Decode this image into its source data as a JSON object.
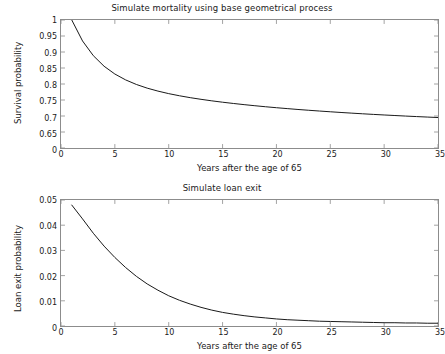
{
  "figure": {
    "width": 444,
    "height": 354,
    "background": "#ffffff",
    "line_color": "#1a1a1a",
    "axis_color": "#8c8c8c",
    "text_color": "#1a1a1a"
  },
  "panels": [
    {
      "title": "Simulate mortality using base geometrical process",
      "xlabel": "Years after the age of 65",
      "ylabel": "Survival probability"
    },
    {
      "title": "Simulate loan exit",
      "xlabel": "Years after the age of 65",
      "ylabel": "Loan exit probability"
    }
  ],
  "chart_data": [
    {
      "type": "line",
      "title": "Simulate mortality using base geometrical process",
      "xlabel": "Years after the age of 65",
      "ylabel": "Survival probability",
      "xlim": [
        0,
        35
      ],
      "ylim": [
        0.6,
        1.0
      ],
      "xticks": [
        0,
        5,
        10,
        15,
        20,
        25,
        30,
        35
      ],
      "xticklabels": [
        "0",
        "5",
        "10",
        "15",
        "20",
        "25",
        "30",
        "35"
      ],
      "yticks": [
        0.6,
        0.65,
        0.7,
        0.75,
        0.8,
        0.85,
        0.9,
        0.95,
        1.0
      ],
      "yticklabels": [
        "0",
        "0.65",
        "0.7",
        "0.75",
        "0.8",
        "0.85",
        "0.9",
        "0.95",
        "1"
      ],
      "grid": false,
      "legend": null,
      "series": [
        {
          "name": "Survival probability",
          "color": "#1a1a1a",
          "x": [
            1,
            2,
            3,
            4,
            5,
            6,
            7,
            8,
            9,
            10,
            11,
            12,
            13,
            14,
            15,
            16,
            17,
            18,
            19,
            20,
            21,
            22,
            23,
            24,
            25,
            26,
            27,
            28,
            29,
            30,
            31,
            32,
            33,
            34,
            35
          ],
          "y": [
            1.0,
            0.9345,
            0.8885,
            0.8555,
            0.8312,
            0.8128,
            0.7985,
            0.7871,
            0.7778,
            0.7699,
            0.7632,
            0.7573,
            0.7521,
            0.7474,
            0.7431,
            0.7392,
            0.7355,
            0.7321,
            0.7289,
            0.7259,
            0.7231,
            0.7204,
            0.7179,
            0.7155,
            0.7132,
            0.711,
            0.7089,
            0.7069,
            0.705,
            0.7032,
            0.7015,
            0.6998,
            0.6982,
            0.6967,
            0.6952
          ]
        }
      ]
    },
    {
      "type": "line",
      "title": "Simulate loan exit",
      "xlabel": "Years after the age of 65",
      "ylabel": "Loan exit probability",
      "xlim": [
        0,
        35
      ],
      "ylim": [
        0,
        0.05
      ],
      "xticks": [
        0,
        5,
        10,
        15,
        20,
        25,
        30,
        35
      ],
      "xticklabels": [
        "0",
        "5",
        "10",
        "15",
        "20",
        "25",
        "30",
        "35"
      ],
      "yticks": [
        0,
        0.01,
        0.02,
        0.03,
        0.04,
        0.05
      ],
      "yticklabels": [
        "0",
        "0.01",
        "0.02",
        "0.03",
        "0.04",
        "0.05"
      ],
      "grid": false,
      "legend": null,
      "series": [
        {
          "name": "Loan exit probability",
          "color": "#1a1a1a",
          "x": [
            1,
            2,
            3,
            4,
            5,
            6,
            7,
            8,
            9,
            10,
            11,
            12,
            13,
            14,
            15,
            16,
            17,
            18,
            19,
            20,
            21,
            22,
            23,
            24,
            25,
            26,
            27,
            28,
            29,
            30,
            31,
            32,
            33,
            34,
            35
          ],
          "y": [
            0.048,
            0.0425,
            0.0368,
            0.0317,
            0.0272,
            0.0232,
            0.0197,
            0.0167,
            0.0142,
            0.012,
            0.0102,
            0.0087,
            0.0074,
            0.0063,
            0.0054,
            0.0047,
            0.0041,
            0.0036,
            0.0032,
            0.0028,
            0.0025,
            0.0023,
            0.0021,
            0.0019,
            0.0018,
            0.0017,
            0.0016,
            0.0015,
            0.0014,
            0.0013,
            0.0013,
            0.0012,
            0.0012,
            0.0011,
            0.0011
          ]
        }
      ]
    }
  ]
}
